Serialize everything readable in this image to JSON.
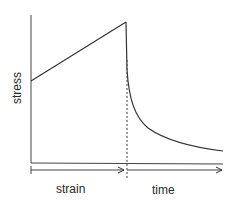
{
  "diagram": {
    "y_axis_label": "stress",
    "x_segments": [
      {
        "label": "strain"
      },
      {
        "label": "time"
      }
    ],
    "curves": [
      {
        "name": "loading-line",
        "type": "linear increase with strain"
      },
      {
        "name": "relaxation-curve",
        "type": "stress decay over time"
      }
    ],
    "divider": "dashed vertical line at end of straining"
  },
  "colors": {
    "line": "#333333",
    "background": "#ffffff"
  }
}
